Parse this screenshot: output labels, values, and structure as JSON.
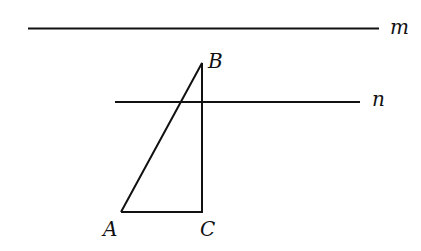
{
  "diagram": {
    "lines": {
      "m": {
        "label": "m"
      },
      "n": {
        "label": "n"
      }
    },
    "points": {
      "A": {
        "label": "A"
      },
      "B": {
        "label": "B"
      },
      "C": {
        "label": "C"
      }
    },
    "colors": {
      "stroke": "#111111",
      "background": "#ffffff"
    }
  }
}
